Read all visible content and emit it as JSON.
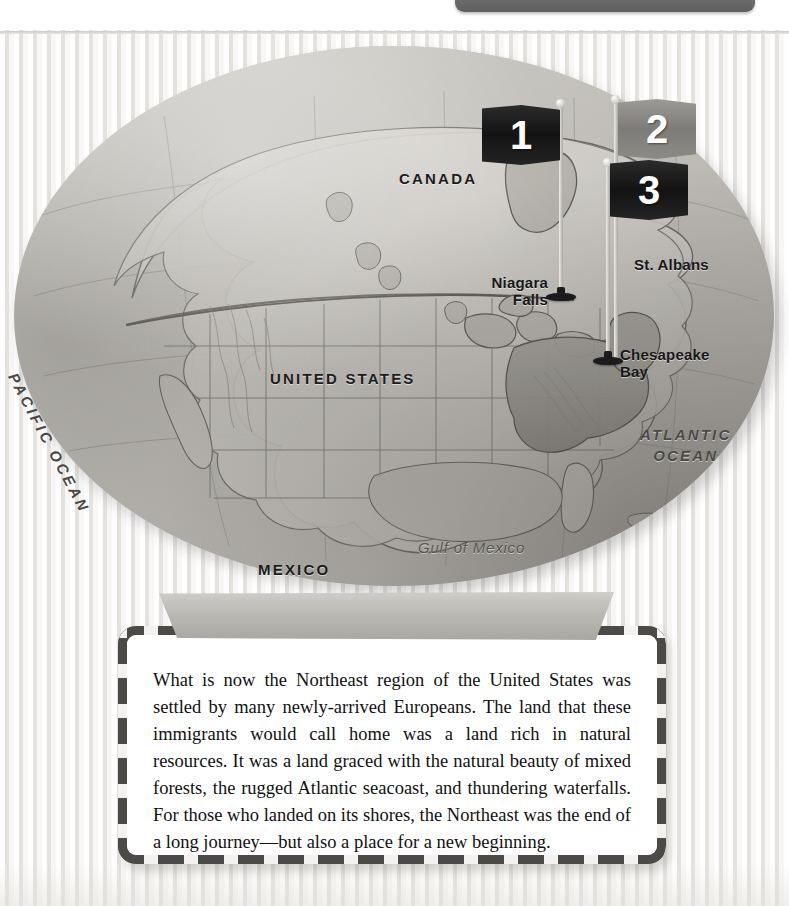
{
  "page": {
    "top_tab": {
      "label": ""
    }
  },
  "map": {
    "labels": {
      "canada": "CANADA",
      "united_states": "UNITED STATES",
      "mexico": "MEXICO",
      "pacific_ocean": "PACIFIC OCEAN",
      "atlantic_ocean_line1": "ATLANTIC",
      "atlantic_ocean_line2": "OCEAN",
      "gulf_of_mexico": "Gulf of Mexico",
      "niagara_falls_line1": "Niagara",
      "niagara_falls_line2": "Falls",
      "st_albans": "St. Albans",
      "chesapeake_bay_line1": "Chesapeake",
      "chesapeake_bay_line2": "Bay"
    },
    "flags": [
      {
        "number": "1",
        "style": "dark"
      },
      {
        "number": "2",
        "style": "light"
      },
      {
        "number": "3",
        "style": "dark"
      }
    ],
    "colors": {
      "flag_dark": "#131313",
      "flag_light": "#7e7c78",
      "land": "#cfcdc8",
      "highlight_region": "#a9a6a0"
    }
  },
  "banner": {
    "title": "Why We Remember"
  },
  "content": {
    "paragraph": "What is now the Northeast region of the United States was settled by many newly-arrived Europeans. The land that these immigrants would call home was a land rich in natural resources. It was a land graced with the natural beauty of mixed forests, the rugged Atlantic seacoast, and thundering waterfalls. For those who landed on its shores, the Northeast was the end of a long journey—but also a place for a new beginning."
  }
}
